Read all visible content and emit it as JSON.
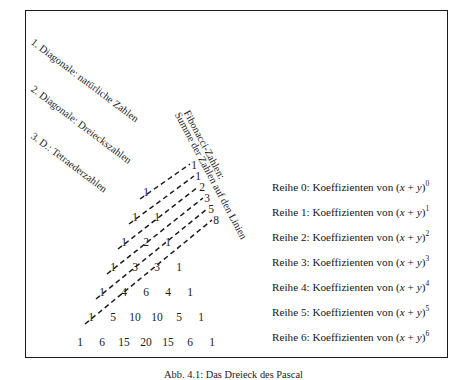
{
  "figure": {
    "caption": "Abb. 4.1: Das Dreieck des Pascal",
    "background_color": "#ffffff",
    "frame_color": "#1b1b1b",
    "ink_color": "#1c1c1c"
  },
  "diagonal_labels": [
    {
      "id": "diag-0",
      "text": "1. Diagonale: natürliche Zahlen"
    },
    {
      "id": "diag-1",
      "text": "2. Diagonale: Dreieckszahlen"
    },
    {
      "id": "diag-2",
      "text": "3. D.: Tetraederzahlen"
    }
  ],
  "fibonacci_label": {
    "line1": "Fibonacci-Zahlen:",
    "line2": "Summe der Zahlen auf den Linien"
  },
  "fibonacci_numbers": [
    {
      "value": "1",
      "x": 194,
      "y": 160
    },
    {
      "value": "1",
      "x": 198,
      "y": 171
    },
    {
      "value": "2",
      "x": 202,
      "y": 182
    },
    {
      "value": "3",
      "x": 207,
      "y": 193
    },
    {
      "value": "5",
      "x": 211,
      "y": 204
    },
    {
      "value": "8",
      "x": 216,
      "y": 215
    }
  ],
  "row_labels": [
    {
      "prefix": "Reihe 0: Koeffizienten von",
      "base": "(x + y)",
      "exponent": "0",
      "y": 182
    },
    {
      "prefix": "Reihe 1: Koeffizienten von",
      "base": "(x + y)",
      "exponent": "1",
      "y": 207
    },
    {
      "prefix": "Reihe 2: Koeffizienten von",
      "base": "(x + y)",
      "exponent": "2",
      "y": 232
    },
    {
      "prefix": "Reihe 3: Koeffizienten von",
      "base": "(x + y)",
      "exponent": "3",
      "y": 257
    },
    {
      "prefix": "Reihe 4: Koeffizienten von",
      "base": "(x + y)",
      "exponent": "4",
      "y": 282
    },
    {
      "prefix": "Reihe 5: Koeffizienten von",
      "base": "(x + y)",
      "exponent": "5",
      "y": 307
    },
    {
      "prefix": "Reihe 6: Koeffizienten von",
      "base": "(x + y)",
      "exponent": "6",
      "y": 332
    }
  ],
  "chart_data": {
    "type": "table",
    "title": "Das Dreieck des Pascal",
    "rows": [
      {
        "row": 0,
        "values": [
          1
        ]
      },
      {
        "row": 1,
        "values": [
          1,
          1
        ]
      },
      {
        "row": 2,
        "values": [
          1,
          2,
          1
        ]
      },
      {
        "row": 3,
        "values": [
          1,
          3,
          3,
          1
        ]
      },
      {
        "row": 4,
        "values": [
          1,
          4,
          6,
          4,
          1
        ]
      },
      {
        "row": 5,
        "values": [
          1,
          5,
          10,
          10,
          5,
          1
        ]
      },
      {
        "row": 6,
        "values": [
          1,
          6,
          15,
          20,
          15,
          6,
          1
        ]
      }
    ],
    "fibonacci_sums": [
      1,
      1,
      2,
      3,
      5,
      8
    ],
    "geometry": {
      "apex_x": 146,
      "apex_y": 187,
      "row_step_y": 25,
      "col_step_x": 22,
      "row_shift_x": -11
    },
    "dashed_lines": [
      {
        "from": [
          140,
          199
        ],
        "to": [
          190,
          164
        ]
      },
      {
        "from": [
          129,
          224
        ],
        "to": [
          194,
          176
        ]
      },
      {
        "from": [
          118,
          249
        ],
        "to": [
          198,
          187
        ]
      },
      {
        "from": [
          107,
          274
        ],
        "to": [
          203,
          198
        ]
      },
      {
        "from": [
          96,
          299
        ],
        "to": [
          207,
          209
        ]
      },
      {
        "from": [
          85,
          324
        ],
        "to": [
          212,
          220
        ]
      }
    ]
  }
}
